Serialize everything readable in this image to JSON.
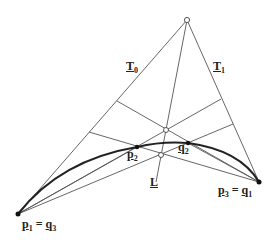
{
  "diagram": {
    "type": "geometric-construction",
    "points": {
      "apex": {
        "x": 187,
        "y": 20
      },
      "P1": {
        "x": 18,
        "y": 214
      },
      "P2": {
        "x": 137,
        "y": 147
      },
      "q2": {
        "x": 188,
        "y": 143
      },
      "P3": {
        "x": 259,
        "y": 182
      },
      "left_mid_upper": {
        "x": 117,
        "y": 101
      },
      "left_mid_lower": {
        "x": 89,
        "y": 132
      },
      "right_mid_upper": {
        "x": 221,
        "y": 99
      },
      "right_mid_lower": {
        "x": 233,
        "y": 124
      },
      "open_circle_upper": {
        "x": 166,
        "y": 130
      },
      "open_circle_lower": {
        "x": 161,
        "y": 155
      },
      "L_end": {
        "x": 156,
        "y": 182
      }
    },
    "labels": {
      "T0": {
        "base": "T",
        "sub": "0"
      },
      "T1": {
        "base": "T",
        "sub": "1"
      },
      "P2": {
        "base": "p",
        "sub": "2"
      },
      "q2": {
        "base": "q",
        "sub": "2"
      },
      "L": {
        "base": "L"
      },
      "P3eq": {
        "left_base": "p",
        "left_sub": "3",
        "eq": "=",
        "right_base": "q",
        "right_sub": "1"
      },
      "P1eq": {
        "left_base": "p",
        "left_sub": "1",
        "eq": "=",
        "right_base": "q",
        "right_sub": "3"
      }
    },
    "colors": {
      "line": "#444444",
      "curve": "#222222",
      "background": "#ffffff"
    }
  }
}
